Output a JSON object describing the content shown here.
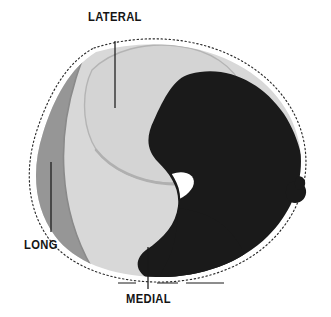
{
  "figure": {
    "labels": {
      "lateral": "LATERAL",
      "long": "LONG",
      "medial": "MEDIAL"
    },
    "colors": {
      "background": "#ffffff",
      "outline_dashed": "#2a2a2a",
      "region_long_gray": "#969696",
      "region_lateral_light": "#d4d4d4",
      "region_medial_light": "#d8d8d8",
      "region_dark": "#1a1a1a",
      "inner_void_white": "#ffffff",
      "leader_line": "#1a1a1a"
    },
    "regions": [
      {
        "name": "long",
        "label": "LONG",
        "fill": "#969696",
        "position": "left"
      },
      {
        "name": "lateral",
        "label": "LATERAL",
        "fill": "#d4d4d4",
        "position": "top-center"
      },
      {
        "name": "medial",
        "label": "MEDIAL",
        "fill": "#d8d8d8",
        "position": "bottom-center"
      },
      {
        "name": "dark-region",
        "label": "",
        "fill": "#1a1a1a",
        "position": "right"
      },
      {
        "name": "inner-void",
        "label": "",
        "fill": "#ffffff",
        "position": "center-right"
      }
    ],
    "leaders": [
      {
        "name": "lateral-leader",
        "x1": 115,
        "y1": 40,
        "x2": 115,
        "y2": 108
      },
      {
        "name": "long-leader",
        "x1": 51,
        "y1": 162,
        "x2": 51,
        "y2": 232
      },
      {
        "name": "medial-leader",
        "x1": 148,
        "y1": 248,
        "x2": 148,
        "y2": 288
      }
    ],
    "scale_marker": {
      "name": "dimension-marker",
      "y": 283,
      "x_start": 120,
      "x_end": 222
    }
  }
}
